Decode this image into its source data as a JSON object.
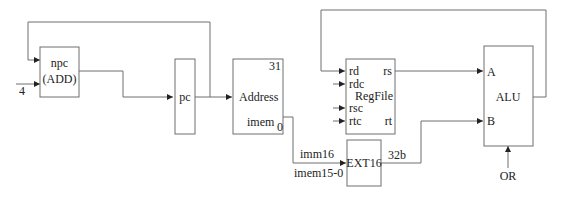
{
  "diagram": {
    "blocks": {
      "npc": {
        "label_line1": "npc",
        "label_line2": "(ADD)",
        "input_const": "4"
      },
      "pc": {
        "label": "pc"
      },
      "imem": {
        "port_address": "Address",
        "name": "imem",
        "bit_high": "31",
        "bit_low": "0"
      },
      "regfile": {
        "name": "RegFile",
        "in_rd": "rd",
        "in_rdc": "rdc",
        "in_rsc": "rsc",
        "in_rtc": "rtc",
        "out_rs": "rs",
        "out_rt": "rt"
      },
      "ext16": {
        "label": "EXT16",
        "in_label_top": "imm16",
        "in_label_bottom": "imem15-0",
        "out_label": "32b"
      },
      "alu": {
        "label": "ALU",
        "in_a": "A",
        "in_b": "B",
        "op": "OR"
      }
    },
    "colors": {
      "line": "#6e6e6e",
      "text": "#222222",
      "background": "#ffffff"
    }
  }
}
